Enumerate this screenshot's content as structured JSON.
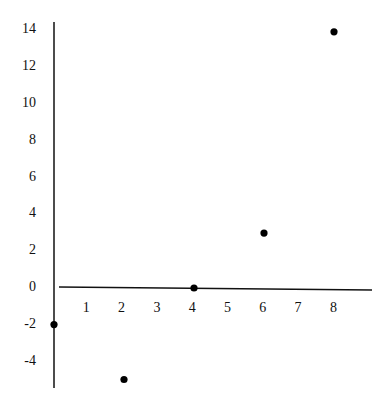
{
  "chart_data": {
    "type": "scatter",
    "title": "",
    "xlabel": "",
    "ylabel": "",
    "x": [
      0,
      2,
      4,
      6,
      8
    ],
    "y": [
      -2,
      -5,
      0,
      3,
      14
    ],
    "points": [
      {
        "x": 0,
        "y": -2
      },
      {
        "x": 2,
        "y": -5
      },
      {
        "x": 4,
        "y": 0
      },
      {
        "x": 6,
        "y": 3
      },
      {
        "x": 8,
        "y": 14
      }
    ],
    "x_ticks": [
      "1",
      "2",
      "3",
      "4",
      "5",
      "6",
      "7",
      "8"
    ],
    "y_ticks": [
      "14",
      "12",
      "10",
      "8",
      "6",
      "4",
      "2",
      "0",
      "-2",
      "-4"
    ],
    "xlim": [
      0,
      9.8
    ],
    "ylim": [
      -5.5,
      14.5
    ],
    "grid": false,
    "legend": null,
    "colors": {
      "axis": "#111111",
      "marker": "#000000"
    }
  }
}
